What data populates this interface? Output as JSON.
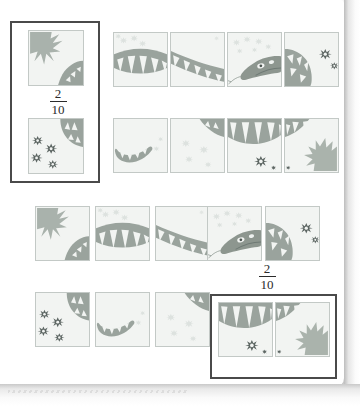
{
  "document": {
    "kind": "scanned-worksheet-page",
    "title_text": "",
    "theme_colors": {
      "tile_background": "#f2f4f2",
      "tile_border": "#c3c9c6",
      "snake_body": "#9aa39d",
      "snake_body_dark": "#7f8a84",
      "grass": "#aab3ad",
      "flower_light": "#d9dedb",
      "flower_dark": "#5d6663",
      "box_outline": "#4a4a4a",
      "text": "#2b2b2b"
    }
  },
  "puzzle": {
    "exercise_1": {
      "answer_box_label": "answer-box-top-left",
      "fraction": {
        "numerator": "2",
        "denominator": "10",
        "display": "2/10"
      },
      "answer_tiles": [
        {
          "id": "a1-t1",
          "alt": "grass-and-snake-tail-tile"
        },
        {
          "id": "a1-t2",
          "alt": "dark-flowers-and-snake-body-tile"
        }
      ],
      "sequence_row_1": [
        {
          "id": "r1-t1",
          "alt": "snake-body-zigzag-with-light-flowers-tile"
        },
        {
          "id": "r1-t2",
          "alt": "snake-body-diagonal-zigzag-tile"
        },
        {
          "id": "r1-t3",
          "alt": "snake-head-with-tongue-and-light-flowers-tile"
        },
        {
          "id": "r1-t4",
          "alt": "snake-coil-with-dark-flowers-tile"
        }
      ],
      "sequence_row_2": [
        {
          "id": "r2-t1",
          "alt": "snake-tail-tip-tile"
        },
        {
          "id": "r2-t2",
          "alt": "light-flowers-only-tile"
        },
        {
          "id": "r2-t3",
          "alt": "snake-body-arc-with-dark-flower-tile"
        },
        {
          "id": "r2-t4",
          "alt": "snake-body-arc-with-grass-tile"
        }
      ]
    },
    "exercise_2": {
      "answer_box_label": "answer-box-bottom-right",
      "fraction": {
        "numerator": "2",
        "denominator": "10",
        "display": "2/10"
      },
      "sequence_row_1": [
        {
          "id": "r3-t1",
          "alt": "grass-and-snake-tail-tile"
        },
        {
          "id": "r3-t2",
          "alt": "snake-body-zigzag-with-light-flowers-tile"
        },
        {
          "id": "r3-t3",
          "alt": "snake-body-diagonal-zigzag-tile"
        },
        {
          "id": "r3-t4",
          "alt": "snake-head-with-tongue-and-light-flowers-tile"
        },
        {
          "id": "r3-t5",
          "alt": "snake-coil-with-dark-flowers-tile"
        }
      ],
      "sequence_row_2": [
        {
          "id": "r4-t1",
          "alt": "dark-flowers-and-snake-body-tile"
        },
        {
          "id": "r4-t2",
          "alt": "snake-tail-tip-tile"
        },
        {
          "id": "r4-t3",
          "alt": "light-flowers-only-tile"
        }
      ],
      "answer_tiles": [
        {
          "id": "a2-t1",
          "alt": "snake-body-arc-with-dark-flower-tile"
        },
        {
          "id": "a2-t2",
          "alt": "snake-body-arc-with-grass-tile"
        }
      ]
    }
  }
}
